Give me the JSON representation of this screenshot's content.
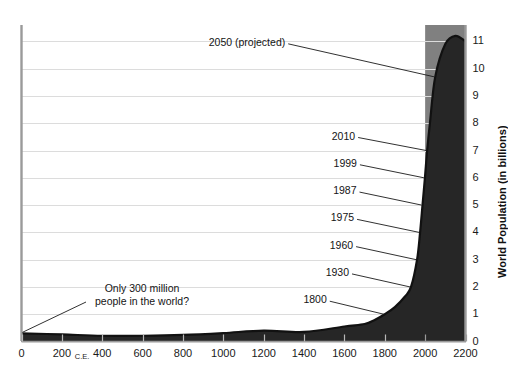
{
  "chart_data": {
    "type": "area",
    "title": "",
    "xlabel": "",
    "ylabel": "World Population (in billions)",
    "xlim": [
      0,
      2200
    ],
    "ylim": [
      0,
      11.6
    ],
    "grid": true,
    "legend": "none",
    "x_era_note": "C.E.",
    "x_ticks": [
      "0",
      "200",
      "400",
      "600",
      "800",
      "1000",
      "1200",
      "1400",
      "1600",
      "1800",
      "2000",
      "2200"
    ],
    "x_tick_values": [
      0,
      200,
      400,
      600,
      800,
      1000,
      1200,
      1400,
      1600,
      1800,
      2000,
      2200
    ],
    "y_ticks": [
      "0",
      "1",
      "2",
      "3",
      "4",
      "5",
      "6",
      "7",
      "8",
      "9",
      "10",
      "11"
    ],
    "y_tick_values": [
      0,
      1,
      2,
      3,
      4,
      5,
      6,
      7,
      8,
      9,
      10,
      11
    ],
    "series": [
      {
        "name": "World Population",
        "x": [
          0,
          200,
          400,
          600,
          800,
          1000,
          1200,
          1400,
          1600,
          1700,
          1750,
          1800,
          1850,
          1900,
          1930,
          1960,
          1975,
          1987,
          1999,
          2010,
          2025,
          2050,
          2100,
          2150,
          2200
        ],
        "values": [
          0.3,
          0.26,
          0.21,
          0.21,
          0.24,
          0.31,
          0.4,
          0.35,
          0.55,
          0.64,
          0.79,
          1.0,
          1.26,
          1.65,
          2.0,
          3.0,
          4.0,
          5.0,
          6.0,
          7.0,
          8.1,
          9.7,
          10.9,
          11.2,
          11.0
        ]
      }
    ],
    "projection_start_year": 2000,
    "annotations": [
      {
        "id": "ann-2050",
        "label": "2050 (projected)",
        "year": 2050,
        "population": 9.7
      },
      {
        "id": "ann-2010",
        "label": "2010",
        "year": 2010,
        "population": 7
      },
      {
        "id": "ann-1999",
        "label": "1999",
        "year": 1999,
        "population": 6
      },
      {
        "id": "ann-1987",
        "label": "1987",
        "year": 1987,
        "population": 5
      },
      {
        "id": "ann-1975",
        "label": "1975",
        "year": 1975,
        "population": 4
      },
      {
        "id": "ann-1960",
        "label": "1960",
        "year": 1960,
        "population": 3
      },
      {
        "id": "ann-1930",
        "label": "1930",
        "year": 1930,
        "population": 2
      },
      {
        "id": "ann-1800",
        "label": "1800",
        "year": 1800,
        "population": 1
      }
    ],
    "callout": {
      "line1": "Only 300 million",
      "line2": "people in the world?",
      "points_to_year": 0,
      "points_to_population": 0.3
    },
    "colors": {
      "area_historical": "#262626",
      "area_projected_band": "#808080",
      "curve_line": "#111111",
      "gridline": "#d9d9d9",
      "axis": "#9a9a9a",
      "text": "#141414"
    }
  }
}
